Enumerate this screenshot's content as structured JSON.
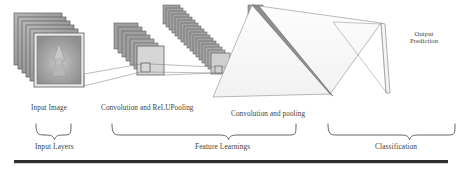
{
  "figure": {
    "background_color": "#ffffff",
    "ink_color": "#4a4a4a",
    "rule_color": "#2e2e2e"
  },
  "stage_labels": {
    "input_image": "Input Image",
    "convolution_relu_pooling": "Convolution and ReLUPooling",
    "convolution_pooling": "Convolution and pooling",
    "output_prediction_line1": "Output",
    "output_prediction_line2": "Prediction"
  },
  "group_labels": {
    "input_layers": "Input Layers",
    "feature_learnings": "Feature Learnings",
    "classification": "Classification"
  },
  "diagram_elements": {
    "input_stack": {
      "name": "input-image-stack",
      "card_count": 6,
      "fill": "#9a9a9a",
      "border": "#5c5c5c",
      "front_card_fill": "#b4b4b4"
    },
    "conv1_stack": {
      "name": "first-feature-map-stack",
      "card_count": 7,
      "fill": "#9f9f9f",
      "border": "#5f5f5f",
      "front_card_fill": "#d3d3d3"
    },
    "conv2_stack": {
      "name": "second-feature-map-stack",
      "card_count": 17,
      "fill": "#a2a2a2",
      "border": "#606060"
    },
    "pool_stack": {
      "name": "pooled-feature-map-stack",
      "card_count": 18,
      "fill": "#a2a2a2",
      "border": "#606060"
    },
    "fully_connected": {
      "name": "fully-connected-layer",
      "fill": "#ffffff",
      "border": "#7a7a7a"
    },
    "output_bar": {
      "name": "output-prediction-bar",
      "fill": "#8e8e8e",
      "border": "#5a5a5a"
    },
    "receptive_field_box": {
      "name": "receptive-field-highlight",
      "border": "#5a5a5a"
    }
  },
  "braces": {
    "input_layers_brace": "input-layers-brace",
    "feature_learnings_brace": "feature-learnings-brace",
    "classification_brace": "classification-brace"
  },
  "bottom_rule": {
    "name": "bottom-rule",
    "color": "#2e2e2e"
  }
}
